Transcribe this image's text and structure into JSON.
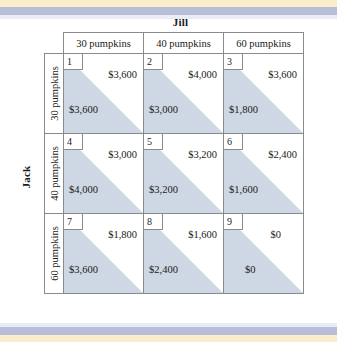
{
  "players": {
    "column_player": "Jill",
    "row_player": "Jack"
  },
  "column_headers": [
    "30 pumpkins",
    "40 pumpkins",
    "60 pumpkins"
  ],
  "row_headers": [
    "30 pumpkins",
    "40 pumpkins",
    "60 pumpkins"
  ],
  "colors": {
    "shade": "#ced8e4",
    "stripe_cream": "#fbeccb",
    "stripe_blue": "#b9bed8",
    "border": "#8a8a8a",
    "text": "#1a1a1a"
  },
  "chart_data": {
    "type": "table",
    "row_player": "Jack",
    "column_player": "Jill",
    "row_categories": [
      "30 pumpkins",
      "40 pumpkins",
      "60 pumpkins"
    ],
    "column_categories": [
      "30 pumpkins",
      "40 pumpkins",
      "60 pumpkins"
    ],
    "cell_note": "Each cell shows a numbered box, Jill's payoff upper-right (white triangle) and Jack's payoff lower-left (shaded triangle).",
    "cells": [
      {
        "number": "1",
        "row": "30 pumpkins",
        "col": "30 pumpkins",
        "jill_payoff": "$3,600",
        "jack_payoff": "$3,600"
      },
      {
        "number": "2",
        "row": "30 pumpkins",
        "col": "40 pumpkins",
        "jill_payoff": "$4,000",
        "jack_payoff": "$3,000"
      },
      {
        "number": "3",
        "row": "30 pumpkins",
        "col": "60 pumpkins",
        "jill_payoff": "$3,600",
        "jack_payoff": "$1,800"
      },
      {
        "number": "4",
        "row": "40 pumpkins",
        "col": "30 pumpkins",
        "jill_payoff": "$3,000",
        "jack_payoff": "$4,000"
      },
      {
        "number": "5",
        "row": "40 pumpkins",
        "col": "40 pumpkins",
        "jill_payoff": "$3,200",
        "jack_payoff": "$3,200"
      },
      {
        "number": "6",
        "row": "40 pumpkins",
        "col": "60 pumpkins",
        "jill_payoff": "$2,400",
        "jack_payoff": "$1,600"
      },
      {
        "number": "7",
        "row": "60 pumpkins",
        "col": "30 pumpkins",
        "jill_payoff": "$1,800",
        "jack_payoff": "$3,600"
      },
      {
        "number": "8",
        "row": "60 pumpkins",
        "col": "40 pumpkins",
        "jill_payoff": "$1,600",
        "jack_payoff": "$2,400"
      },
      {
        "number": "9",
        "row": "60 pumpkins",
        "col": "60 pumpkins",
        "jill_payoff": "$0",
        "jack_payoff": "$0"
      }
    ]
  }
}
